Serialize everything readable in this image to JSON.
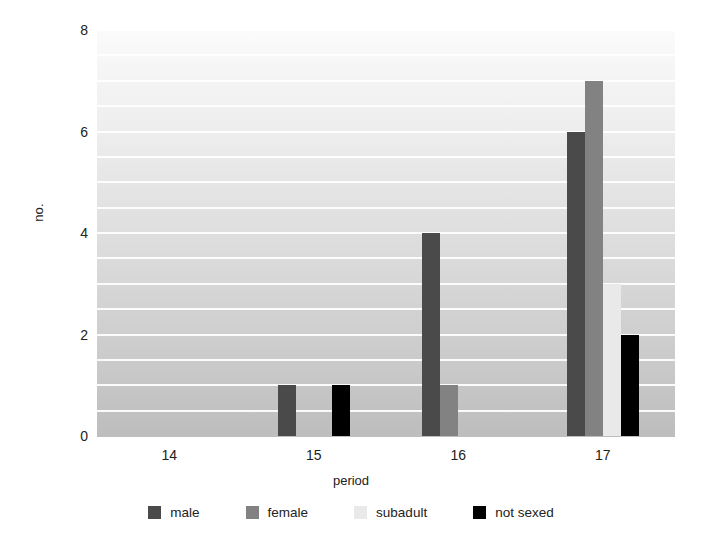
{
  "chart_data": {
    "type": "bar",
    "title": "",
    "subtitle": "",
    "xlabel": "period",
    "ylabel": "no.",
    "categories": [
      "14",
      "15",
      "16",
      "17"
    ],
    "series": [
      {
        "name": "male",
        "color": "#4a4a4a",
        "values": [
          0,
          1,
          4,
          6
        ]
      },
      {
        "name": "female",
        "color": "#828282",
        "values": [
          0,
          0,
          1,
          7
        ]
      },
      {
        "name": "subadult",
        "color": "#e9e9e9",
        "values": [
          0,
          0,
          0,
          3
        ]
      },
      {
        "name": "not sexed",
        "color": "#000000",
        "values": [
          0,
          1,
          0,
          2
        ]
      }
    ],
    "ylim": [
      0,
      8
    ],
    "yticks": [
      "0",
      "2",
      "4",
      "6",
      "8"
    ],
    "ytick_values": [
      0,
      2,
      4,
      6,
      8
    ],
    "gridlines_at": [
      0.5,
      1,
      1.5,
      2,
      2.5,
      3,
      3.5,
      4,
      4.5,
      5,
      5.5,
      6,
      6.5,
      7,
      7.5,
      8
    ],
    "grid": true,
    "grid_color": "#ffffff",
    "legend_position": "bottom",
    "plot_background": "vertical-gradient-light-to-gray",
    "bar_group_mode": "grouped"
  },
  "legend": {
    "items": [
      {
        "label": "male",
        "color": "#4a4a4a"
      },
      {
        "label": "female",
        "color": "#828282"
      },
      {
        "label": "subadult",
        "color": "#e9e9e9"
      },
      {
        "label": "not sexed",
        "color": "#000000"
      }
    ]
  },
  "axes": {
    "y_title": "no.",
    "x_title": "period",
    "y_tick_labels": [
      "8",
      "6",
      "4",
      "2",
      "0"
    ],
    "x_tick_labels": [
      "14",
      "15",
      "16",
      "17"
    ]
  }
}
